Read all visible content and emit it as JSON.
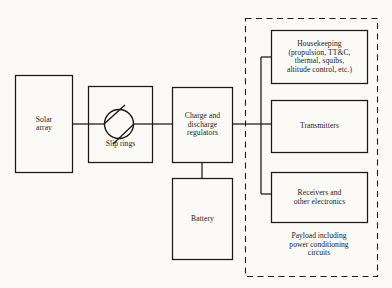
{
  "diagram": {
    "background_color": "#fbfaf7",
    "line_color": "#1a1a1a",
    "blocks": [
      {
        "id": "solar_array",
        "label": "Solar\narray"
      },
      {
        "id": "slip_rings",
        "label": "Slip rings"
      },
      {
        "id": "regulators",
        "label": "Charge and\ndischarge\nregulators"
      },
      {
        "id": "battery",
        "label": "Battery"
      },
      {
        "id": "housekeeping",
        "label": "Housekeeping\n(propulsion, TT&C,\nthermal, squibs,\naltitude control, etc.)"
      },
      {
        "id": "transmitters",
        "label": "Transmitters"
      },
      {
        "id": "receivers",
        "label": "Receivers and\nother electronics"
      }
    ],
    "payload_caption": "Payload including\npower conditioning\ncircuits"
  }
}
